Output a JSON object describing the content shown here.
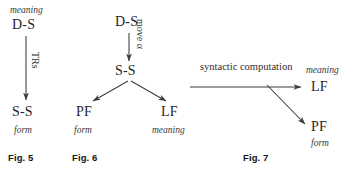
{
  "figure_set": {
    "title": "Syntactic model diagrams",
    "background_color": "#ffffff",
    "ink_color": "#262626"
  },
  "fig5": {
    "caption": "Fig. 5",
    "top_gloss": "meaning",
    "top_node": "D-S",
    "edge_label": "TRs",
    "bottom_node": "S-S",
    "bottom_gloss": "form"
  },
  "fig6": {
    "caption": "Fig. 6",
    "top_node": "D-S",
    "edge_label": "move α",
    "mid_node": "S-S",
    "left_node": "PF",
    "left_gloss": "form",
    "right_node": "LF",
    "right_gloss": "meaning"
  },
  "fig7": {
    "caption": "Fig. 7",
    "edge_label": "syntactic computation",
    "lf_node": "LF",
    "lf_gloss": "meaning",
    "pf_node": "PF",
    "pf_gloss": "form"
  }
}
